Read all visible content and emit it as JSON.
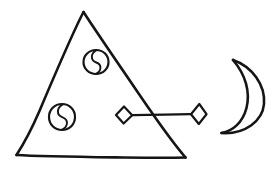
{
  "document": {
    "kind": "hand-drawn-sketch",
    "title": "Pyramid with crescent moon and linked diamonds",
    "background_color": "#ffffff",
    "ink_color": "#151515",
    "canvas": {
      "width": 279,
      "height": 170
    }
  },
  "shapes": {
    "triangle": {
      "name": "Triangle",
      "label": "pyramid-outline",
      "stroke_color": "#151515",
      "stroke_width": 2.6,
      "fill": "none",
      "points": "83,12 185,157 16,155",
      "apex": {
        "x": 83,
        "y": 12
      },
      "bottom_left": {
        "x": 16,
        "y": 155
      },
      "bottom_right": {
        "x": 185,
        "y": 157
      }
    },
    "circle_upper": {
      "name": "Upper circle with S-divider",
      "label": "yin-yang-circle-upper",
      "center": {
        "x": 96,
        "y": 62
      },
      "radius": 12,
      "stroke_color": "#151515",
      "stroke_width": 2.2,
      "inner_curve": "M 96 50 C 89 56, 103 62, 96 68 C 89 72, 93 74, 96 74"
    },
    "circle_lower": {
      "name": "Lower circle with S-divider",
      "label": "yin-yang-circle-lower",
      "center": {
        "x": 62,
        "y": 117
      },
      "radius": 13,
      "stroke_color": "#151515",
      "stroke_width": 2.2,
      "inner_curve": "M 63 104 C 55 110, 70 117, 62 124 C 56 128, 59 130, 62 130"
    },
    "diamond_left": {
      "name": "Left diamond node",
      "label": "diamond-node-left",
      "center": {
        "x": 124,
        "y": 115
      },
      "half_width": 8,
      "half_height": 9,
      "stroke_color": "#151515",
      "stroke_width": 2.0
    },
    "diamond_right": {
      "name": "Right diamond node",
      "label": "diamond-node-right",
      "center": {
        "x": 199,
        "y": 114
      },
      "half_width": 8,
      "half_height": 10,
      "stroke_color": "#151515",
      "stroke_width": 2.0
    },
    "connector": {
      "name": "Connector line between diamonds",
      "label": "diamond-connector-line",
      "from": {
        "x": 132,
        "y": 115
      },
      "to": {
        "x": 191,
        "y": 114
      },
      "stroke_color": "#151515",
      "stroke_width": 2.2
    },
    "crescent": {
      "name": "Crescent moon",
      "label": "crescent-moon",
      "stroke_color": "#151515",
      "stroke_width": 2.4,
      "fill": "none",
      "opens_toward": "left",
      "top_tip": {
        "x": 233,
        "y": 60
      },
      "bottom_tip": {
        "x": 222,
        "y": 133
      },
      "outer_path": "M 233 60 C 253 66, 266 85, 264 104 C 262 122, 244 134, 222 133",
      "inner_path": "M 233 60 C 245 74, 250 92, 246 108 C 242 123, 232 131, 222 133"
    }
  }
}
